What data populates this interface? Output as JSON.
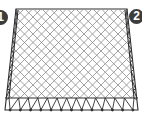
{
  "diagram": {
    "type": "space-frame-truss",
    "labels": [
      {
        "id": "marker-1",
        "text": "1"
      },
      {
        "id": "marker-2",
        "text": "2"
      }
    ],
    "colors": {
      "lines": "#3a3a3a",
      "lattice": "#8a8a8a",
      "badge": "#3c3c3c",
      "background": "#ffffff"
    },
    "lattice_cells": 14,
    "bottom_truss_bays": 13
  }
}
